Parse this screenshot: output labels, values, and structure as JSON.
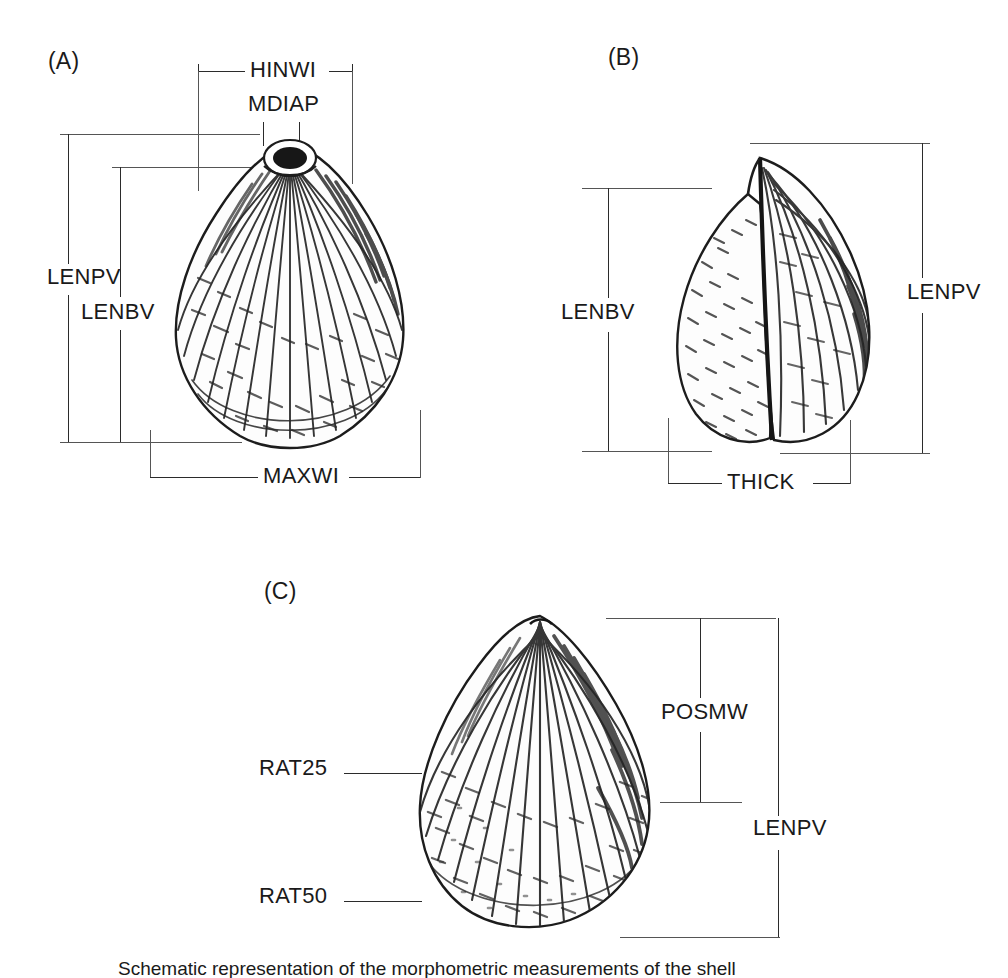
{
  "figure": {
    "background_color": "#ffffff",
    "line_color": "#2b2b2b",
    "guide_color": "#555555",
    "text_color": "#1a1a1a"
  },
  "panels": [
    {
      "id": "A",
      "label": "(A)",
      "view": "exterior lateral view of left valve",
      "measurements": [
        {
          "key": "HINWI",
          "label": "HINWI",
          "orientation": "horizontal",
          "position": "top"
        },
        {
          "key": "MDIAP",
          "label": "MDIAP",
          "orientation": "horizontal",
          "position": "umbo"
        },
        {
          "key": "LENPV",
          "label": "LENPV",
          "orientation": "vertical",
          "position": "left-outer"
        },
        {
          "key": "LENBV",
          "label": "LENBV",
          "orientation": "vertical",
          "position": "left-inner"
        },
        {
          "key": "MAXWI",
          "label": "MAXWI",
          "orientation": "horizontal",
          "position": "bottom"
        }
      ]
    },
    {
      "id": "B",
      "label": "(B)",
      "view": "dorsal / anterior view of articulated valves",
      "measurements": [
        {
          "key": "LENBV",
          "label": "LENBV",
          "orientation": "vertical",
          "position": "left"
        },
        {
          "key": "LENPV",
          "label": "LENPV",
          "orientation": "vertical",
          "position": "right"
        },
        {
          "key": "THICK",
          "label": "THICK",
          "orientation": "horizontal",
          "position": "bottom"
        }
      ]
    },
    {
      "id": "C",
      "label": "(C)",
      "view": "exterior lateral view with ratio measurement levels",
      "measurements": [
        {
          "key": "POSMW",
          "label": "POSMW",
          "orientation": "vertical",
          "position": "right-inner"
        },
        {
          "key": "LENPV",
          "label": "LENPV",
          "orientation": "vertical",
          "position": "right-outer"
        },
        {
          "key": "RAT25",
          "label": "RAT25",
          "orientation": "leader",
          "position": "left-upper"
        },
        {
          "key": "RAT50",
          "label": "RAT50",
          "orientation": "leader",
          "position": "left-lower"
        }
      ]
    }
  ],
  "caption": {
    "text": "Schematic representation of the morphometric measurements of the shell"
  }
}
